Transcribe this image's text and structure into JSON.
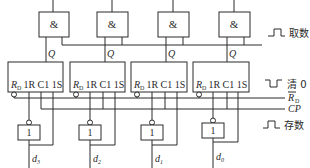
{
  "diagram": {
    "and_gates": [
      {
        "label": "&",
        "output_label": "Q"
      },
      {
        "label": "&",
        "output_label": "Q"
      },
      {
        "label": "&",
        "output_label": "Q"
      },
      {
        "label": "&",
        "output_label": "Q"
      }
    ],
    "flip_flops": [
      {
        "rd": "R",
        "rd_sub": "D",
        "pins": "1R C1 1S"
      },
      {
        "rd": "R",
        "rd_sub": "D",
        "pins": "1R C1 1S"
      },
      {
        "rd": "R",
        "rd_sub": "D",
        "pins": "1R C1 1S"
      },
      {
        "rd": "R",
        "rd_sub": "D",
        "pins": "1R C1 1S"
      }
    ],
    "inverters": [
      {
        "label": "1"
      },
      {
        "label": "1"
      },
      {
        "label": "1"
      },
      {
        "label": "1"
      }
    ],
    "inputs": [
      {
        "name": "d",
        "sub": "3"
      },
      {
        "name": "d",
        "sub": "2"
      },
      {
        "name": "d",
        "sub": "1"
      },
      {
        "name": "d",
        "sub": "0"
      }
    ],
    "signals": {
      "read": {
        "label": "取数",
        "pulse": "positive"
      },
      "clear": {
        "label": "清 0",
        "pulse": "negative"
      },
      "rd_bus": {
        "label": "R",
        "sub": "D",
        "overbar": true
      },
      "cp_bus": {
        "label": "CP"
      },
      "store": {
        "label": "存数",
        "pulse": "positive"
      }
    }
  }
}
